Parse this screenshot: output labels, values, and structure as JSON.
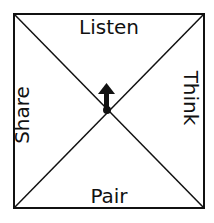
{
  "diagram": {
    "type": "spinner-square",
    "sections": {
      "top": "Listen",
      "right": "Think",
      "bottom": "Pair",
      "left": "Share"
    },
    "center_arrow": "arrow-up",
    "line_color": "#111111",
    "background": "#ffffff"
  }
}
